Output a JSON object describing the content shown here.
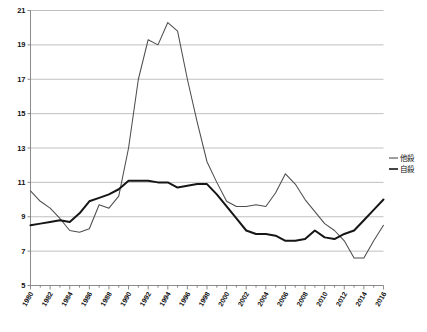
{
  "chart_data": {
    "type": "line",
    "title": "",
    "xlabel": "",
    "ylabel": "",
    "ylim": [
      5,
      21
    ],
    "xlim": [
      1980,
      2016
    ],
    "ytick_interval": 2,
    "xtick_interval": 2,
    "grid": true,
    "legend_position": "right-middle",
    "ytick_labels": [
      "21",
      "19",
      "17",
      "15",
      "13",
      "11",
      "9",
      "7",
      "5"
    ],
    "ytick_values": [
      21,
      19,
      17,
      15,
      13,
      11,
      9,
      7,
      5
    ],
    "xtick_labels": [
      "1980",
      "1982",
      "1984",
      "1986",
      "1988",
      "1990",
      "1992",
      "1994",
      "1996",
      "1998",
      "2000",
      "2002",
      "2004",
      "2006",
      "2008",
      "2010",
      "2012",
      "2014",
      "2016"
    ],
    "xtick_values": [
      1980,
      1982,
      1984,
      1986,
      1988,
      1990,
      1992,
      1994,
      1996,
      1998,
      2000,
      2002,
      2004,
      2006,
      2008,
      2010,
      2012,
      2014,
      2016
    ],
    "x": [
      1980,
      1981,
      1982,
      1983,
      1984,
      1985,
      1986,
      1987,
      1988,
      1989,
      1990,
      1991,
      1992,
      1993,
      1994,
      1995,
      1996,
      1997,
      1998,
      1999,
      2000,
      2001,
      2002,
      2003,
      2004,
      2005,
      2006,
      2007,
      2008,
      2009,
      2010,
      2011,
      2012,
      2013,
      2014,
      2015,
      2016
    ],
    "series": [
      {
        "name": "他殺",
        "style": "thin",
        "color": "#4d4d4d",
        "values": [
          10.5,
          9.9,
          9.5,
          8.9,
          8.2,
          8.1,
          8.3,
          9.7,
          9.5,
          10.2,
          13.0,
          17.0,
          19.3,
          19.0,
          20.3,
          19.8,
          17.0,
          14.5,
          12.2,
          11.0,
          9.9,
          9.6,
          9.6,
          9.7,
          9.6,
          10.4,
          11.5,
          10.9,
          10.0,
          9.3,
          8.6,
          8.2,
          7.6,
          6.6,
          6.6,
          7.6,
          8.5
        ]
      },
      {
        "name": "自殺",
        "style": "thick",
        "color": "#161616",
        "values": [
          8.5,
          8.6,
          8.7,
          8.8,
          8.7,
          9.2,
          9.9,
          10.1,
          10.3,
          10.6,
          11.1,
          11.1,
          11.1,
          11.0,
          11.0,
          10.7,
          10.8,
          10.9,
          10.9,
          10.3,
          9.6,
          8.9,
          8.2,
          8.0,
          8.0,
          7.9,
          7.6,
          7.6,
          7.7,
          8.2,
          7.8,
          7.7,
          8.0,
          8.2,
          8.8,
          9.4,
          10.0
        ]
      }
    ]
  },
  "legend": {
    "items": [
      {
        "label": "他殺",
        "style": "thin"
      },
      {
        "label": "自殺",
        "style": "thick"
      }
    ]
  }
}
